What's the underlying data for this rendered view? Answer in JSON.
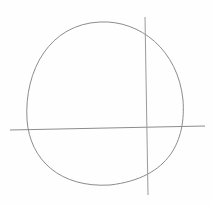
{
  "sketch": {
    "description": "Pencil sketch of a circle with a horizontal and a vertical construction line",
    "stroke_color": "#8a8a8a",
    "background": "#fefefe",
    "circle": {
      "cx": 105,
      "cy": 104,
      "rx": 79,
      "ry": 82
    },
    "horizontal_line": {
      "x1": 10,
      "y1": 130,
      "x2": 205,
      "y2": 126
    },
    "vertical_line": {
      "x1": 145,
      "y1": 17,
      "x2": 148,
      "y2": 195
    }
  }
}
